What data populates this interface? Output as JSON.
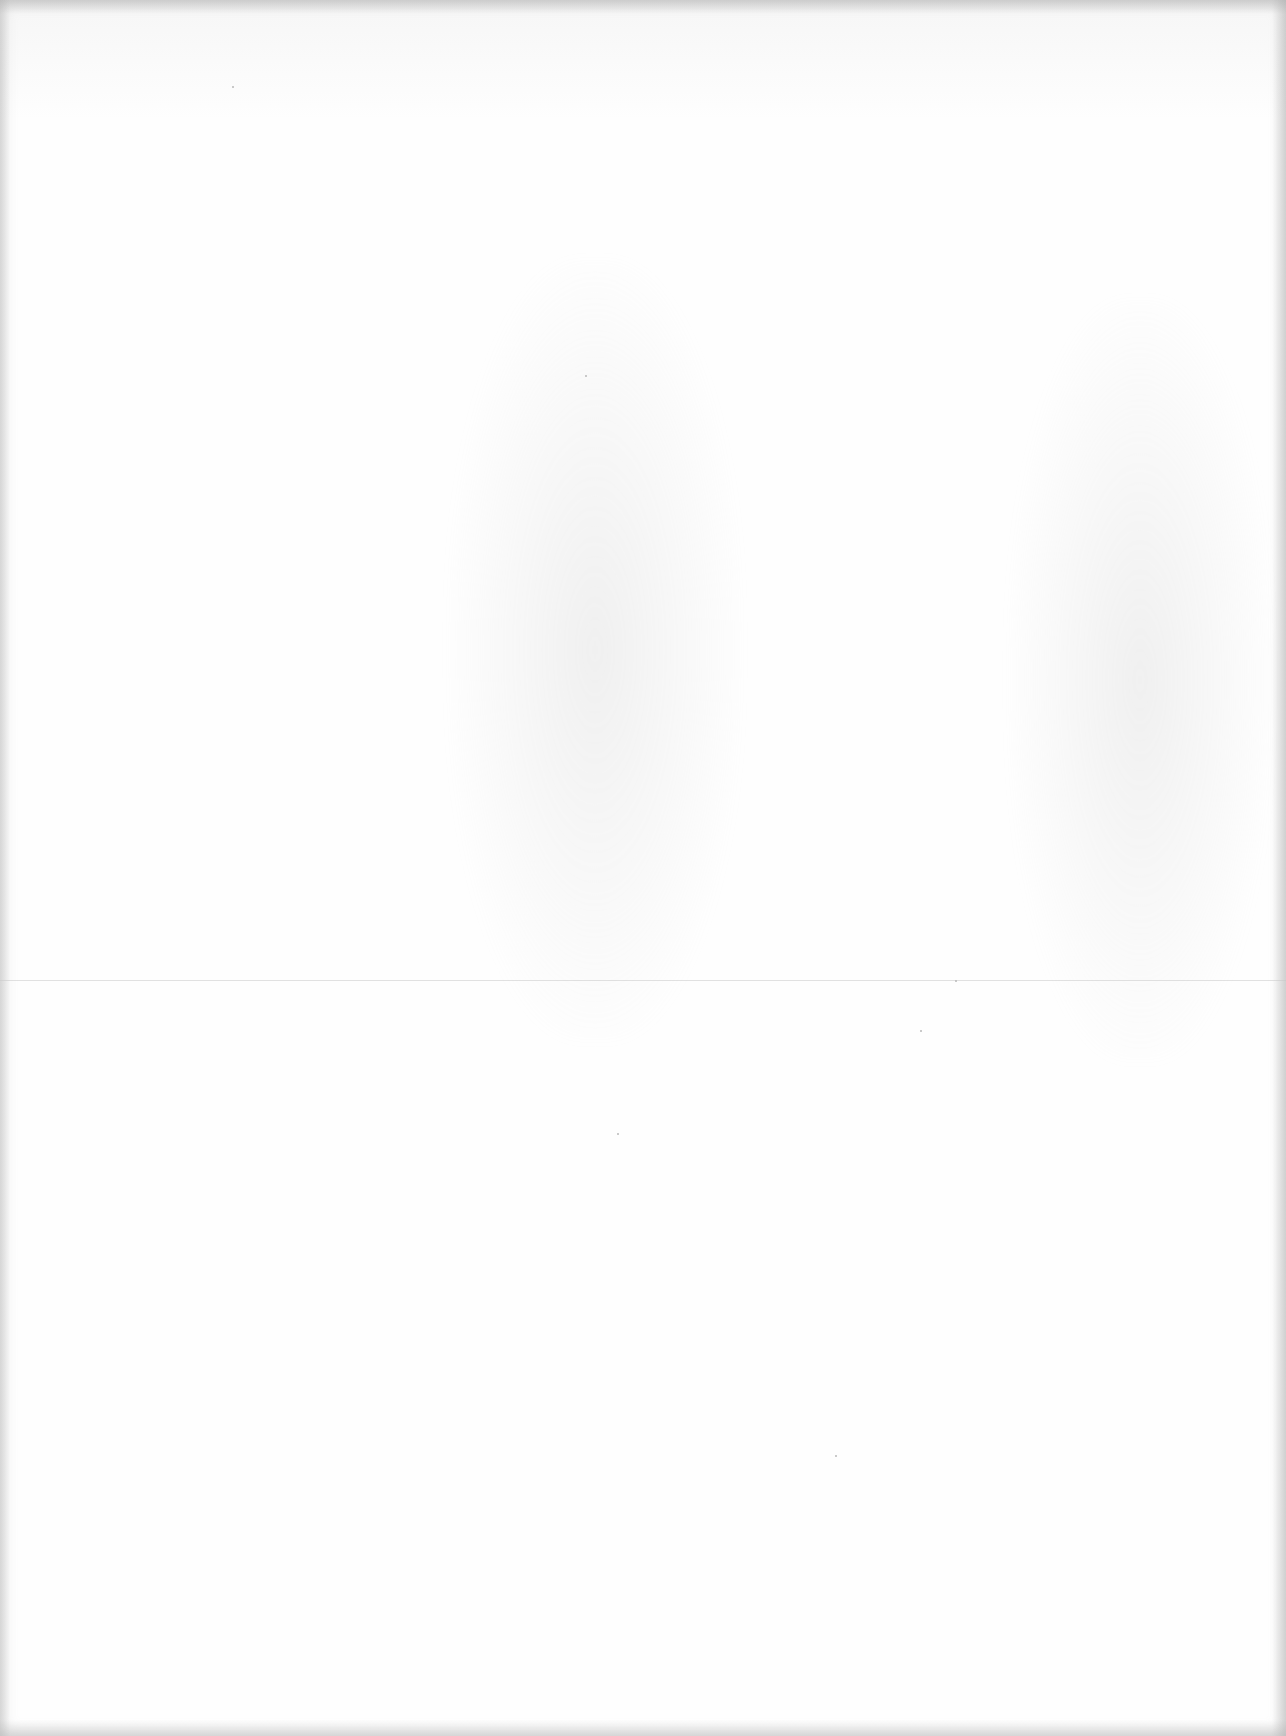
{
  "document": {
    "type": "blank scanned page",
    "text_content": "",
    "background_color": "#fefefe",
    "edge_shade_color": "#a0a0a0",
    "fold_line": {
      "orientation": "horizontal",
      "y": 980,
      "color": "#c8c8c8"
    },
    "show_through_regions": [
      {
        "name": "center",
        "x": 450,
        "y": 260,
        "width": 290,
        "height": 780
      },
      {
        "name": "right",
        "x": 1010,
        "y": 300,
        "width": 260,
        "height": 760
      }
    ]
  }
}
